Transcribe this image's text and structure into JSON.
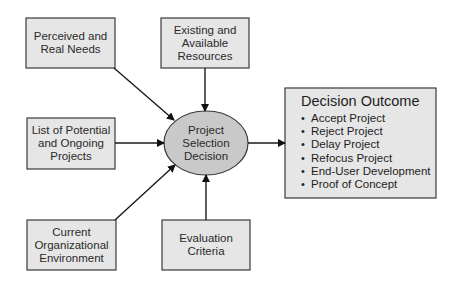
{
  "diagram": {
    "center": {
      "lines": [
        "Project",
        "Selection",
        "Decision"
      ]
    },
    "inputs": [
      {
        "id": "needs",
        "lines": [
          "Perceived and",
          "Real Needs"
        ]
      },
      {
        "id": "resources",
        "lines": [
          "Existing and",
          "Available",
          "Resources"
        ]
      },
      {
        "id": "projects",
        "lines": [
          "List of Potential",
          "and Ongoing",
          "Projects"
        ]
      },
      {
        "id": "environment",
        "lines": [
          "Current",
          "Organizational",
          "Environment"
        ]
      },
      {
        "id": "criteria",
        "lines": [
          "Evaluation",
          "Criteria"
        ]
      }
    ],
    "outcome": {
      "title": "Decision Outcome",
      "items": [
        "Accept Project",
        "Reject Project",
        "Delay Project",
        "Refocus Project",
        "End-User Development",
        "Proof of Concept"
      ]
    },
    "colors": {
      "box_fill": "#e6e6e6",
      "ellipse_fill": "#c9c9c9",
      "stroke": "#3a3a3a"
    }
  }
}
